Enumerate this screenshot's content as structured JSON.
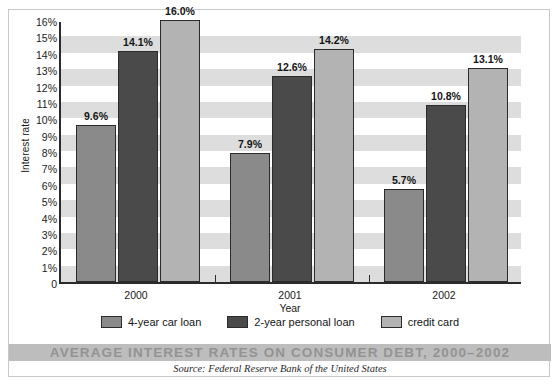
{
  "chart_data": {
    "type": "bar",
    "title": "AVERAGE INTEREST RATES ON CONSUMER DEBT, 2000–2002",
    "source": "Source: Federal Reserve Bank of the United States",
    "xlabel": "Year",
    "ylabel": "Interest rate",
    "categories": [
      "2000",
      "2001",
      "2002"
    ],
    "ylim": [
      0,
      16
    ],
    "ytick_values": [
      16,
      15,
      14,
      13,
      12,
      11,
      10,
      9,
      8,
      7,
      6,
      5,
      4,
      3,
      2,
      1,
      0
    ],
    "ytick_labels": [
      "16%",
      "15%",
      "14%",
      "13%",
      "12%",
      "11%",
      "10%",
      "9%",
      "8%",
      "7%",
      "6%",
      "5%",
      "4%",
      "3%",
      "2%",
      "1%",
      "0"
    ],
    "grid": "horizontal alternating gray bands, one per 1%",
    "legend_position": "bottom-center",
    "series": [
      {
        "name": "4-year car loan",
        "color": "#8a8a8a",
        "values": [
          9.6,
          7.9,
          5.7
        ],
        "labels": [
          "9.6%",
          "7.9%",
          "5.7%"
        ]
      },
      {
        "name": "2-year personal loan",
        "color": "#4a4a4a",
        "values": [
          14.1,
          12.6,
          10.8
        ],
        "labels": [
          "14.1%",
          "12.6%",
          "10.8%"
        ]
      },
      {
        "name": "credit card",
        "color": "#b3b3b3",
        "values": [
          16.0,
          14.2,
          13.1
        ],
        "labels": [
          "16.0%",
          "14.2%",
          "13.1%"
        ]
      }
    ]
  },
  "colors": {
    "band": "#dddddd",
    "axis": "#2b2b2b",
    "title_band": "#bdbdbd",
    "title_text": "#939393"
  }
}
